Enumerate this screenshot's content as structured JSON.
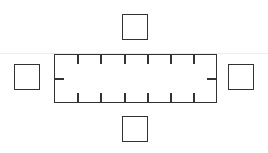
{
  "diagram": {
    "type": "seating-layout",
    "table": {
      "shape": "rectangle",
      "top_ticks": 6,
      "bottom_ticks": 6,
      "side_ticks": 1
    },
    "chairs": [
      {
        "position": "top"
      },
      {
        "position": "bottom"
      },
      {
        "position": "left"
      },
      {
        "position": "right"
      }
    ],
    "colors": {
      "stroke": "#333333",
      "background": "#ffffff",
      "guide_line": "#ececec"
    }
  }
}
